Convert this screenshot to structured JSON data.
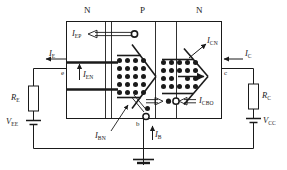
{
  "figure": {
    "regions": [
      {
        "name": "emitter-region",
        "label": "N"
      },
      {
        "name": "base-region",
        "label": "P"
      },
      {
        "name": "collector-region",
        "label": "N"
      }
    ],
    "terminals": [
      {
        "name": "emitter-terminal",
        "label": "e"
      },
      {
        "name": "base-terminal",
        "label": "b"
      },
      {
        "name": "collector-terminal",
        "label": "c"
      }
    ],
    "currents": [
      {
        "name": "emitter-hole-current",
        "symbol": "I",
        "sub": "EP",
        "text": "IEP"
      },
      {
        "name": "emitter-current",
        "symbol": "I",
        "sub": "E",
        "text": "IE"
      },
      {
        "name": "emitter-electron-current",
        "symbol": "I",
        "sub": "EN",
        "text": "IEN"
      },
      {
        "name": "base-recombination-current",
        "symbol": "I",
        "sub": "BN",
        "text": "IBN"
      },
      {
        "name": "base-current",
        "symbol": "I",
        "sub": "B",
        "text": "IB"
      },
      {
        "name": "collector-electron-current",
        "symbol": "I",
        "sub": "CN",
        "text": "ICN"
      },
      {
        "name": "collector-current",
        "symbol": "I",
        "sub": "C",
        "text": "IC"
      },
      {
        "name": "collector-base-leakage-current",
        "symbol": "I",
        "sub": "CBO",
        "text": "ICBO"
      }
    ],
    "components": [
      {
        "name": "emitter-resistor",
        "symbol": "R",
        "sub": "E",
        "text": "RE"
      },
      {
        "name": "collector-resistor",
        "symbol": "R",
        "sub": "C",
        "text": "RC"
      },
      {
        "name": "emitter-supply-source",
        "symbol": "V",
        "sub": "EE",
        "text": "VEE"
      },
      {
        "name": "collector-supply-source",
        "symbol": "V",
        "sub": "CC",
        "text": "VCC"
      }
    ],
    "carriers": {
      "electron_symbol": "filled-dot",
      "hole_symbol": "open-circle",
      "electron_grid_left": {
        "cols": 5,
        "rows": 5
      },
      "electron_grid_right": {
        "cols": 5,
        "rows": 5
      }
    },
    "colors": {
      "line": "#1a1a1a",
      "background": "#ffffff",
      "text": "#1a1a1a"
    }
  }
}
